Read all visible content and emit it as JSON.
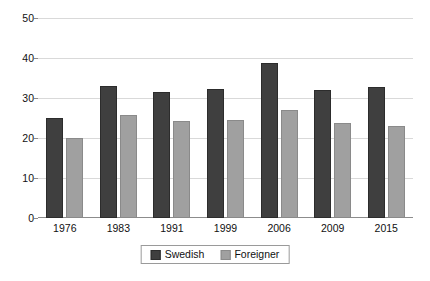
{
  "chart_data": {
    "type": "bar",
    "title": "",
    "subtitle": "",
    "xlabel": "",
    "ylabel": "",
    "ylim": [
      0,
      50
    ],
    "yticks": [
      0,
      10,
      20,
      30,
      40,
      50
    ],
    "ytick_labels": [
      "0",
      "10",
      "20",
      "30",
      "40",
      "50"
    ],
    "grid": true,
    "legend_position": "bottom-center",
    "categories": [
      "1976",
      "1983",
      "1991",
      "1999",
      "2006",
      "2009",
      "2015"
    ],
    "series": [
      {
        "name": "Swedish",
        "color": "#3f3f3f",
        "values": [
          25.0,
          33.0,
          31.5,
          32.3,
          38.7,
          31.9,
          32.8
        ]
      },
      {
        "name": "Foreigner",
        "color": "#a0a0a0",
        "values": [
          19.9,
          25.7,
          24.3,
          24.5,
          27.1,
          23.8,
          23.1
        ]
      }
    ]
  },
  "legend": {
    "entries": [
      {
        "label": "Swedish"
      },
      {
        "label": "Foreigner"
      }
    ]
  },
  "colors": {
    "swedish": "#3f3f3f",
    "foreigner": "#a0a0a0",
    "gridline": "#d9d9d9",
    "axis": "#8c8c8c",
    "background": "#ffffff"
  }
}
